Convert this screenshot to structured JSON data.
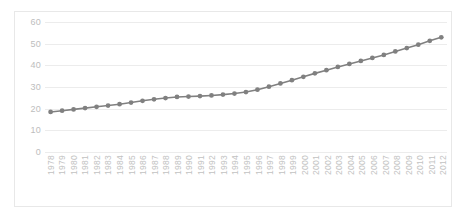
{
  "chart_data": {
    "type": "line",
    "title": "",
    "xlabel": "",
    "ylabel": "",
    "ylim": [
      0,
      60
    ],
    "yticks": [
      0,
      10,
      20,
      30,
      40,
      50,
      60
    ],
    "grid": true,
    "legend": "none",
    "marker": "circle",
    "series_color": "#808080",
    "grid_color": "#ececec",
    "axis_text_color": "#c2c2c2",
    "categories": [
      "1978",
      "1979",
      "1980",
      "1981",
      "1982",
      "1983",
      "1984",
      "1985",
      "1986",
      "1987",
      "1988",
      "1989",
      "1990",
      "1991",
      "1992",
      "1993",
      "1994",
      "1995",
      "1996",
      "1997",
      "1998",
      "1999",
      "2000",
      "2001",
      "2002",
      "2003",
      "2004",
      "2005",
      "2006",
      "2007",
      "2008",
      "2009",
      "2010",
      "2011",
      "2012"
    ],
    "series": [
      {
        "name": "",
        "values": [
          18.0,
          18.6,
          19.2,
          19.8,
          20.4,
          21.0,
          21.6,
          22.4,
          23.2,
          23.9,
          24.5,
          25.0,
          25.2,
          25.4,
          25.7,
          26.1,
          26.6,
          27.3,
          28.4,
          29.8,
          31.3,
          32.8,
          34.4,
          36.0,
          37.5,
          39.0,
          40.4,
          41.8,
          43.2,
          44.6,
          46.2,
          47.8,
          49.4,
          51.2,
          52.8
        ]
      }
    ]
  },
  "caption": ""
}
